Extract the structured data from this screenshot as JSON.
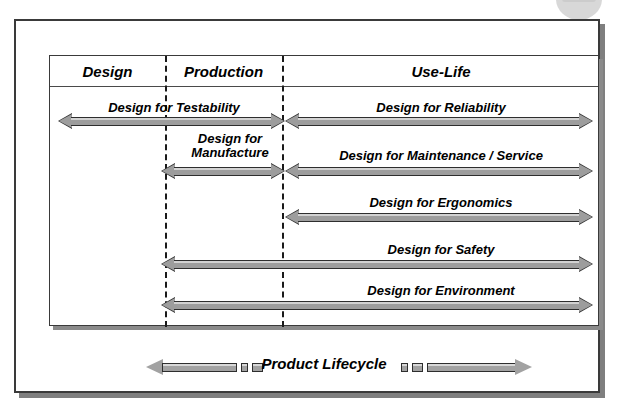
{
  "diagram": {
    "columns": [
      {
        "id": "design",
        "label": "Design"
      },
      {
        "id": "production",
        "label": "Production"
      },
      {
        "id": "uselife",
        "label": "Use-Life"
      }
    ],
    "rows": [
      {
        "id": "testability",
        "label": "Design for Testability",
        "span": "design-to-production"
      },
      {
        "id": "reliability",
        "label": "Design for Reliability",
        "span": "use-life"
      },
      {
        "id": "manufacture",
        "label_line1": "Design for",
        "label_line2": "Manufacture",
        "label": "Design for Manufacture",
        "span": "production"
      },
      {
        "id": "maintenance",
        "label": "Design for Maintenance / Service",
        "span": "use-life"
      },
      {
        "id": "ergonomics",
        "label": "Design for Ergonomics",
        "span": "use-life"
      },
      {
        "id": "safety",
        "label": "Design for Safety",
        "span": "production-to-use-life"
      },
      {
        "id": "environment",
        "label": "Design for Environment",
        "span": "production-to-use-life"
      }
    ],
    "lifecycle": {
      "label": "Product Lifecycle",
      "start_icon": "crying-baby-icon",
      "end_icon": "tombstone-grave-icon"
    },
    "colors": {
      "arrow_fill": "#9d9d9d",
      "arrow_highlight": "#d2d2d2",
      "arrow_outline": "#2e2e2e",
      "frame": "#3a3a3a",
      "divider": "#1a1a1a",
      "text": "#000000",
      "background": "#ffffff"
    }
  }
}
